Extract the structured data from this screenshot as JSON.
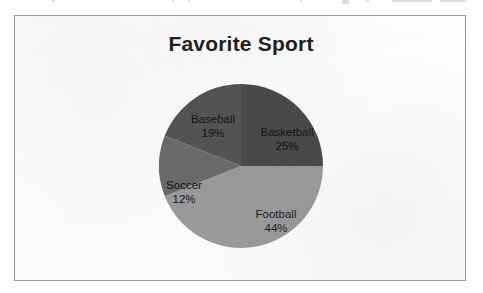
{
  "chart": {
    "title": "Favorite Sport",
    "frame_border_color": "#9a9a9a",
    "background_color": "#fdfdfd"
  },
  "chart_data": {
    "type": "pie",
    "title": "Favorite Sport",
    "xlabel": "",
    "ylabel": "",
    "legend_position": "none",
    "labels_inside_slices": true,
    "start_angle_deg": 0,
    "direction": "clockwise",
    "categories": [
      "Basketball",
      "Football",
      "Soccer",
      "Baseball"
    ],
    "values": [
      25,
      44,
      12,
      19
    ],
    "unit": "%",
    "colors": [
      "#4a4a4a",
      "#9b9b9b",
      "#6b6b6b",
      "#545454"
    ],
    "slices": [
      {
        "name": "Basketball",
        "value": 25,
        "label": "Basketball",
        "percent_text": "25%",
        "color": "#4a4a4a",
        "start_deg": 0,
        "end_deg": 90
      },
      {
        "name": "Football",
        "value": 44,
        "label": "Football",
        "percent_text": "44%",
        "color": "#9b9b9b",
        "start_deg": 90,
        "end_deg": 248.4
      },
      {
        "name": "Soccer",
        "value": 12,
        "label": "Soccer",
        "percent_text": "12%",
        "color": "#6b6b6b",
        "start_deg": 248.4,
        "end_deg": 291.6
      },
      {
        "name": "Baseball",
        "value": 19,
        "label": "Baseball",
        "percent_text": "19%",
        "color": "#545454",
        "start_deg": 291.6,
        "end_deg": 360
      }
    ]
  }
}
